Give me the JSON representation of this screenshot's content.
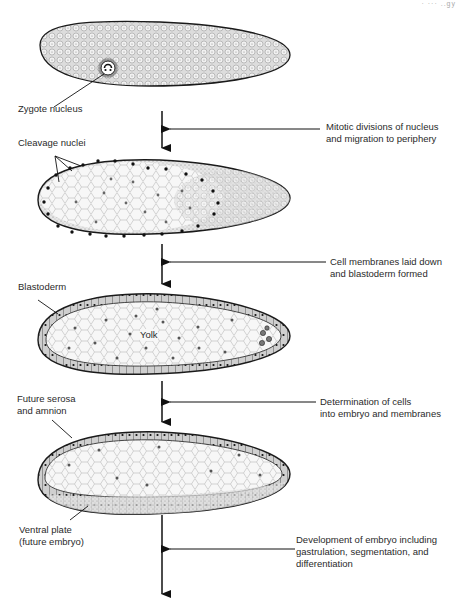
{
  "page_header_fragment": "· ··· ..gy",
  "stages": [
    {
      "id": "zygote",
      "labels": [
        {
          "name": "zygote-nucleus-label",
          "lines": [
            "Zygote nucleus"
          ]
        }
      ]
    },
    {
      "id": "cleavage",
      "labels": [
        {
          "name": "cleavage-nuclei-label",
          "lines": [
            "Cleavage nuclei"
          ]
        }
      ]
    },
    {
      "id": "blastoderm",
      "labels": [
        {
          "name": "blastoderm-label",
          "lines": [
            "Blastoderm"
          ]
        },
        {
          "name": "yolk-label",
          "lines": [
            "Yolk"
          ]
        }
      ]
    },
    {
      "id": "determination",
      "labels": [
        {
          "name": "future-serosa-label",
          "lines": [
            "Future serosa",
            "and amnion"
          ]
        },
        {
          "name": "ventral-plate-label",
          "lines": [
            "Ventral plate",
            "(future embryo)"
          ]
        }
      ]
    }
  ],
  "transitions": [
    {
      "name": "transition-1",
      "lines": [
        "Mitotic divisions of nucleus",
        "and migration to periphery"
      ]
    },
    {
      "name": "transition-2",
      "lines": [
        "Cell membranes laid down",
        "and blastoderm formed"
      ]
    },
    {
      "name": "transition-3",
      "lines": [
        "Determination of cells",
        "into embryo and membranes"
      ]
    },
    {
      "name": "transition-4",
      "lines": [
        "Development of embryo including",
        "gastrulation, segmentation, and",
        "differentiation"
      ]
    }
  ],
  "colors": {
    "ink": "#1a1a1a",
    "cell_fill": "#e9e9e9",
    "stipple": "#b5b5b5",
    "background": "#ffffff"
  }
}
